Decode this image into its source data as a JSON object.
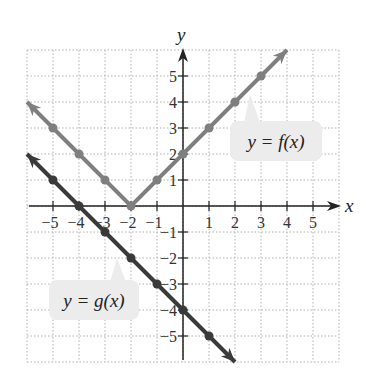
{
  "chart_data": {
    "type": "line",
    "title": "",
    "xlabel": "x",
    "ylabel": "y",
    "xlim": [
      -6,
      6
    ],
    "ylim": [
      -6,
      6
    ],
    "grid": true,
    "grid_style": "dotted",
    "x_ticks": [
      "-5",
      "-4",
      "-3",
      "-2",
      "-1",
      "1",
      "2",
      "3",
      "4",
      "5"
    ],
    "y_ticks": [
      "5",
      "4",
      "3",
      "2",
      "1",
      "-1",
      "-2",
      "-3",
      "-4",
      "-5"
    ],
    "series": [
      {
        "name": "y = f(x)",
        "color": "#7f7f7f",
        "equation_hint": "f(x) = |x + 2|",
        "points": [
          [
            -5,
            3
          ],
          [
            -4,
            2
          ],
          [
            -3,
            1
          ],
          [
            -2,
            0
          ],
          [
            -1,
            1
          ],
          [
            0,
            2
          ],
          [
            1,
            3
          ],
          [
            2,
            4
          ],
          [
            3,
            5
          ]
        ],
        "line_from": [
          -6,
          4
        ],
        "line_vertex": [
          -2,
          0
        ],
        "line_to": [
          4,
          6
        ]
      },
      {
        "name": "y = g(x)",
        "color": "#3a3a3a",
        "equation_hint": "g(x) = -x - 4",
        "points": [
          [
            -5,
            1
          ],
          [
            -4,
            0
          ],
          [
            -3,
            -1
          ],
          [
            -2,
            -2
          ],
          [
            -1,
            -3
          ],
          [
            0,
            -4
          ],
          [
            1,
            -5
          ]
        ],
        "line_from": [
          -6,
          2
        ],
        "line_to": [
          2,
          -6
        ]
      }
    ],
    "annotations": [
      {
        "text": "y = f(x)",
        "series": "y = f(x)"
      },
      {
        "text": "y = g(x)",
        "series": "y = g(x)"
      }
    ]
  },
  "labels": {
    "x_axis": "x",
    "y_axis": "y",
    "f_label": "y = f(x)",
    "g_label": "y = g(x)"
  },
  "colors": {
    "grid": "#b0b0b0",
    "axis": "#222222",
    "f_line": "#7f7f7f",
    "g_line": "#3a3a3a",
    "callout_bg": "#ececec"
  }
}
